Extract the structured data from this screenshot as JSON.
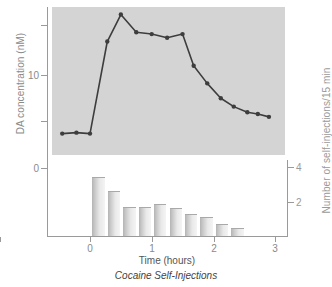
{
  "figure": {
    "caption": "Cocaine Self-Injections",
    "xlabel": "Time (hours)",
    "left_axis_title": "DA concentration (nM)",
    "right_axis_title": "Number of self-injections/15 min"
  },
  "left_axis": {
    "ticks": [
      {
        "value": 0,
        "label": "0"
      },
      {
        "value": 5,
        "label": ""
      },
      {
        "value": 10,
        "label": "10"
      },
      {
        "value": 15,
        "label": ""
      }
    ]
  },
  "right_axis": {
    "ticks": [
      {
        "value": 2,
        "label": "2"
      },
      {
        "value": 4,
        "label": "4"
      }
    ]
  },
  "x_axis": {
    "ticks": [
      {
        "value": 0,
        "label": "0"
      },
      {
        "value": 1,
        "label": "1"
      },
      {
        "value": 2,
        "label": "2"
      },
      {
        "value": 3,
        "label": "3"
      }
    ]
  },
  "chart_data": [
    {
      "type": "line",
      "title": "Cocaine Self-Injections",
      "name": "DA concentration",
      "xlabel": "Time (hours)",
      "ylabel": "DA concentration (nM)",
      "xlim": [
        -0.6,
        3.05
      ],
      "ylim": [
        0,
        17.5
      ],
      "yticks": [
        0,
        5,
        10,
        15
      ],
      "ytick_labels": [
        "0",
        "",
        "10",
        ""
      ],
      "xticks": [
        0,
        1,
        2,
        3
      ],
      "grid": false,
      "legend": "none",
      "marker": "filled-circle",
      "color": "#3d3d3d",
      "plot_background": "#d4d4d4",
      "x": [
        -0.45,
        -0.22,
        0.0,
        0.28,
        0.5,
        0.75,
        1.0,
        1.25,
        1.5,
        1.68,
        1.9,
        2.12,
        2.33,
        2.55,
        2.72,
        2.9
      ],
      "y": [
        3.7,
        3.8,
        3.7,
        13.6,
        16.5,
        14.6,
        14.4,
        14.0,
        14.4,
        11.0,
        9.1,
        7.5,
        6.6,
        6.0,
        5.8,
        5.5
      ]
    },
    {
      "type": "bar",
      "name": "Number of self-injections/15 min",
      "xlabel": "Time (hours)",
      "ylabel": "Number of self-injections/15 min",
      "ylim": [
        0,
        4.4
      ],
      "yticks": [
        2,
        4
      ],
      "ytick_labels": [
        "2",
        "4"
      ],
      "xticks": [
        0,
        1,
        2,
        3
      ],
      "grid": false,
      "legend": "none",
      "color": "#cccccc",
      "bar_width_hours": 0.2,
      "categories": [
        0.14,
        0.39,
        0.64,
        0.89,
        1.14,
        1.39,
        1.64,
        1.89,
        2.14,
        2.39
      ],
      "values": [
        3.45,
        2.6,
        1.7,
        1.7,
        1.85,
        1.6,
        1.25,
        1.1,
        0.7,
        0.45
      ]
    }
  ]
}
